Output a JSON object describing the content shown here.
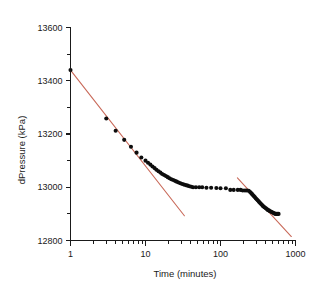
{
  "chart_data": {
    "type": "scatter",
    "title": "",
    "xlabel": "Time (minutes)",
    "ylabel": "dPressure (kPa)",
    "xscale": "log",
    "yscale": "linear",
    "xlim": [
      1,
      1000
    ],
    "ylim": [
      12800,
      13600
    ],
    "grid": false,
    "legend": false,
    "x_tick_labels": [
      "1",
      "10",
      "100",
      "1000"
    ],
    "x_tick_values": [
      1,
      10,
      100,
      1000
    ],
    "y_tick_labels": [
      "12800",
      "13000",
      "13200",
      "13400",
      "13600"
    ],
    "y_tick_values": [
      12800,
      13000,
      13200,
      13400,
      13600
    ],
    "y_minor_tick_values": [
      12900,
      13100,
      13300,
      13500
    ],
    "series": [
      {
        "name": "dPressure data",
        "marker": "filled-circle",
        "color": "#0d0d0d",
        "x": [
          1.0,
          3.0,
          4.0,
          5.2,
          6.4,
          7.6,
          8.8,
          10.0,
          10.8,
          11.6,
          12.4,
          13.2,
          14.0,
          14.9,
          15.8,
          16.7,
          17.7,
          18.7,
          19.8,
          20.9,
          22.1,
          23.4,
          24.7,
          26.1,
          27.6,
          29.2,
          30.9,
          32.6,
          34.5,
          36.5,
          38.6,
          40.8,
          43.1,
          47.0,
          52.0,
          57.0,
          65.0,
          75.0,
          88.0,
          100.0,
          118.0,
          135.0,
          150.0,
          170.0,
          185.0,
          198.0,
          212.0,
          225.0,
          238.0,
          248.0,
          256.0,
          264.0,
          272.0,
          280.0,
          288.0,
          297.0,
          306.0,
          315.0,
          325.0,
          335.0,
          345.0,
          356.0,
          367.0,
          378.0,
          390.0,
          402.0,
          414.0,
          427.0,
          440.0,
          453.0,
          467.0,
          481.0,
          496.0,
          511.0,
          527.0,
          543.0,
          560.0,
          577.0,
          595.0
        ],
        "y": [
          13440,
          13258,
          13212,
          13178,
          13152,
          13130,
          13112,
          13100,
          13092,
          13085,
          13078,
          13072,
          13066,
          13060,
          13055,
          13050,
          13046,
          13042,
          13038,
          13034,
          13030,
          13027,
          13024,
          13021,
          13018,
          13015,
          13012,
          13010,
          13008,
          13006,
          13004,
          13002,
          13000,
          13000,
          13000,
          13000,
          12998,
          12998,
          12997,
          12996,
          12996,
          12990,
          12990,
          12990,
          12990,
          12988,
          12988,
          12988,
          12987,
          12982,
          12978,
          12974,
          12970,
          12966,
          12962,
          12958,
          12954,
          12950,
          12946,
          12942,
          12938,
          12934,
          12930,
          12927,
          12924,
          12921,
          12918,
          12915,
          12913,
          12911,
          12909,
          12907,
          12905,
          12903,
          12901,
          12900,
          12900,
          12900,
          12900
        ]
      }
    ],
    "annotations": [
      {
        "name": "early-time-fit-line",
        "type": "line",
        "color": "#c96a5a",
        "x0": 1.0,
        "y0": 13440,
        "x1": 33.0,
        "y1": 12893
      },
      {
        "name": "late-time-fit-line",
        "type": "line",
        "color": "#c96a5a",
        "x0": 168.0,
        "y0": 13035,
        "x1": 880.0,
        "y1": 12815
      }
    ]
  },
  "axes": {
    "y_title": "dPressure (kPa)",
    "x_title": "Time (minutes)"
  }
}
